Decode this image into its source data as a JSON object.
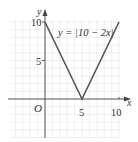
{
  "chart_data": {
    "type": "line",
    "title": "",
    "xlabel": "x",
    "ylabel": "y",
    "origin_label": "O",
    "function_label": "y = |10 − 2x|",
    "series": [
      {
        "name": "y = |10 − 2x|",
        "x": [
          0,
          5,
          10
        ],
        "y": [
          10,
          0,
          10
        ]
      }
    ],
    "xticks": [
      5,
      10
    ],
    "xtick_labels": [
      "5",
      "10"
    ],
    "yticks": [
      5,
      10
    ],
    "ytick_labels": [
      "5",
      "10"
    ],
    "xlim": [
      -4.5,
      10.5
    ],
    "ylim": [
      -5,
      10.5
    ],
    "grid": true,
    "legend": "none"
  },
  "colors": {
    "line": "#555555",
    "axis": "#444444",
    "grid": "#e4e4e4",
    "text": "#333333"
  }
}
